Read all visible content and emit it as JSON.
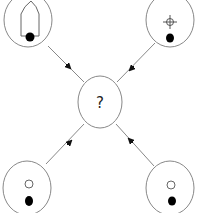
{
  "diagram": {
    "center_node": {
      "label": "?"
    },
    "nodes": [
      {
        "id": "top-left",
        "glyph": "pointed-arch-with-dot"
      },
      {
        "id": "top-right",
        "glyph": "crosshair-with-dot"
      },
      {
        "id": "bottom-left",
        "glyph": "open-circle-with-dot"
      },
      {
        "id": "bottom-right",
        "glyph": "open-circle-with-dot"
      }
    ],
    "edges": [
      {
        "from": "top-left",
        "to": "center"
      },
      {
        "from": "top-right",
        "to": "center"
      },
      {
        "from": "bottom-left",
        "to": "center"
      },
      {
        "from": "bottom-right",
        "to": "center"
      }
    ],
    "colors": {
      "stroke": "#777777",
      "fill_dot": "#000000",
      "text": "#222222"
    }
  }
}
